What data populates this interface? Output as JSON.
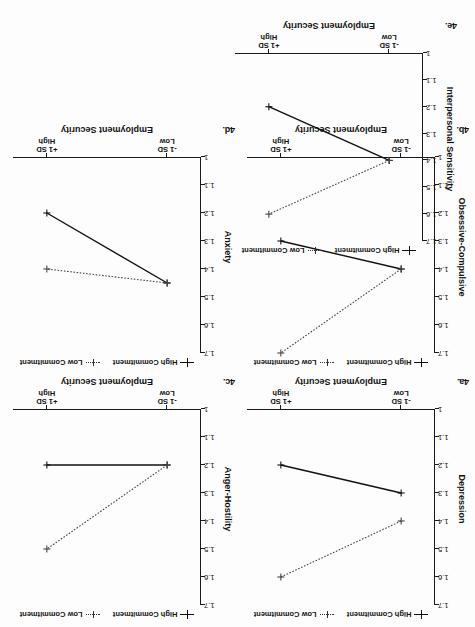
{
  "figure": {
    "orientation": "rotated-180",
    "x_axis_label": "Employment Security",
    "x_tick_labels": [
      "-1 SD\nLow",
      "+1 SD\nHigh"
    ],
    "x_tick_low_line1": "-1 SD",
    "x_tick_low_line2": "Low",
    "x_tick_high_line1": "+1 SD",
    "x_tick_high_line2": "High",
    "legend": {
      "series1_label": "High Commitment",
      "series2_label": "Low Commitment",
      "series1_icon": "solid-line-cross-marker",
      "series2_icon": "dotted-line-cross-marker"
    },
    "y_tick_labels": [
      "1.7",
      "1.6",
      "1.5",
      "1.4",
      "1.3",
      "1.2",
      "1.1",
      "1"
    ],
    "colors": {
      "high_commitment": "#111111",
      "low_commitment": "#444444",
      "axis": "#1a1a1a",
      "background": "#ffffff"
    }
  },
  "chart_data": [
    {
      "id": "4a",
      "panel_label": "4a.",
      "type": "line",
      "title": "",
      "ylabel": "Depression",
      "xlabel": "Employment Security",
      "categories": [
        "-1 SD Low",
        "+1 SD High"
      ],
      "yticks": [
        1.7,
        1.6,
        1.5,
        1.4,
        1.3,
        1.2,
        1.1,
        1
      ],
      "ylim": [
        1,
        1.7
      ],
      "grid": false,
      "legend_position": "top",
      "series": [
        {
          "name": "High Commitment",
          "style": "solid",
          "values": [
            1.3,
            1.2
          ]
        },
        {
          "name": "Low Commitment",
          "style": "dotted",
          "values": [
            1.4,
            1.6
          ]
        }
      ]
    },
    {
      "id": "4b",
      "panel_label": "4b.",
      "type": "line",
      "title": "",
      "ylabel": "Obsessive-Compulsive",
      "xlabel": "Employment Security",
      "categories": [
        "-1 SD Low",
        "+1 SD High"
      ],
      "yticks": [
        1.7,
        1.6,
        1.5,
        1.4,
        1.3,
        1.2,
        1.1,
        1
      ],
      "ylim": [
        1,
        1.7
      ],
      "grid": false,
      "legend_position": "top",
      "series": [
        {
          "name": "High Commitment",
          "style": "solid",
          "values": [
            1.4,
            1.3
          ]
        },
        {
          "name": "Low Commitment",
          "style": "dotted",
          "values": [
            1.4,
            1.7
          ]
        }
      ]
    },
    {
      "id": "4c",
      "panel_label": "4c.",
      "type": "line",
      "title": "",
      "ylabel": "Anger-Hostility",
      "xlabel": "Employment Security",
      "categories": [
        "-1 SD Low",
        "+1 SD High"
      ],
      "yticks": [
        1.7,
        1.6,
        1.5,
        1.4,
        1.3,
        1.2,
        1.1,
        1
      ],
      "ylim": [
        1,
        1.7
      ],
      "grid": false,
      "legend_position": "top",
      "series": [
        {
          "name": "High Commitment",
          "style": "solid",
          "values": [
            1.2,
            1.2
          ]
        },
        {
          "name": "Low Commitment",
          "style": "dotted",
          "values": [
            1.2,
            1.5
          ]
        }
      ]
    },
    {
      "id": "4d",
      "panel_label": "4d.",
      "type": "line",
      "title": "",
      "ylabel": "Anxiety",
      "xlabel": "Employment Security",
      "categories": [
        "-1 SD Low",
        "+1 SD High"
      ],
      "yticks": [
        1.7,
        1.6,
        1.5,
        1.4,
        1.3,
        1.2,
        1.1,
        1
      ],
      "ylim": [
        1,
        1.7
      ],
      "grid": false,
      "legend_position": "top",
      "series": [
        {
          "name": "High Commitment",
          "style": "solid",
          "values": [
            1.45,
            1.2
          ]
        },
        {
          "name": "Low Commitment",
          "style": "dotted",
          "values": [
            1.45,
            1.4
          ]
        }
      ]
    },
    {
      "id": "4e",
      "panel_label": "4e.",
      "type": "line",
      "title": "",
      "ylabel": "Interpersonal Sensitivity",
      "xlabel": "Employment Security",
      "categories": [
        "-1 SD Low",
        "+1 SD High"
      ],
      "yticks": [
        1.7,
        1.6,
        1.5,
        1.4,
        1.3,
        1.2,
        1.1,
        1
      ],
      "ylim": [
        1,
        1.7
      ],
      "grid": false,
      "legend_position": "top",
      "series": [
        {
          "name": "High Commitment",
          "style": "solid",
          "values": [
            1.4,
            1.2
          ]
        },
        {
          "name": "Low Commitment",
          "style": "dotted",
          "values": [
            1.4,
            1.6
          ]
        }
      ]
    }
  ]
}
